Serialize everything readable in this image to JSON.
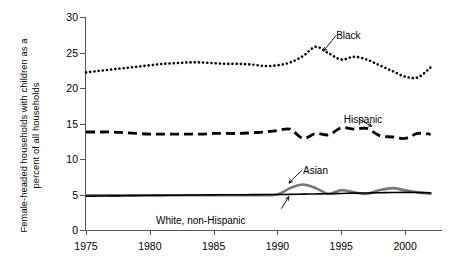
{
  "chart_data": {
    "type": "line",
    "title": "",
    "xlabel": "",
    "ylabel_line1": "Female-headed households with children as a",
    "ylabel_line2": "percent of all households",
    "xlim": [
      1975,
      2002.5
    ],
    "ylim": [
      0,
      30
    ],
    "yticks": [
      0,
      5,
      10,
      15,
      20,
      25,
      30
    ],
    "xticks": [
      1975,
      1980,
      1985,
      1990,
      1995,
      2000
    ],
    "grid": false,
    "legend": "inline annotation labels with leader lines",
    "x": [
      1975,
      1976,
      1977,
      1978,
      1979,
      1980,
      1981,
      1982,
      1983,
      1984,
      1985,
      1986,
      1987,
      1988,
      1989,
      1990,
      1991,
      1992,
      1993,
      1994,
      1995,
      1996,
      1997,
      1998,
      1999,
      2000,
      2001,
      2002
    ],
    "series": [
      {
        "name": "Black",
        "style": "dotted",
        "color": "#000000",
        "values": [
          22.2,
          22.4,
          22.6,
          22.8,
          23.0,
          23.2,
          23.4,
          23.5,
          23.6,
          23.6,
          23.5,
          23.4,
          23.4,
          23.3,
          23.1,
          23.2,
          23.6,
          24.5,
          25.8,
          24.9,
          24.0,
          24.4,
          24.0,
          23.2,
          22.4,
          21.6,
          21.5,
          22.9
        ]
      },
      {
        "name": "Hispanic",
        "style": "dashed",
        "color": "#000000",
        "values": [
          13.8,
          13.8,
          13.8,
          13.7,
          13.6,
          13.5,
          13.5,
          13.5,
          13.5,
          13.5,
          13.6,
          13.6,
          13.6,
          13.7,
          13.8,
          14.0,
          14.2,
          12.9,
          13.6,
          13.4,
          14.4,
          14.2,
          14.3,
          13.3,
          13.1,
          12.9,
          13.6,
          13.5
        ]
      },
      {
        "name": "Asian",
        "style": "solid-thick-gray",
        "color": "#777777",
        "values": [
          4.9,
          4.9,
          4.9,
          4.9,
          4.9,
          4.9,
          4.9,
          4.9,
          4.9,
          4.9,
          4.9,
          4.9,
          4.9,
          4.9,
          4.9,
          5.0,
          5.9,
          6.4,
          5.9,
          5.1,
          5.6,
          5.3,
          5.1,
          5.6,
          5.9,
          5.6,
          5.3,
          5.1
        ]
      },
      {
        "name": "White, non-Hispanic",
        "style": "solid-thin-black",
        "color": "#000000",
        "values": [
          4.75,
          4.78,
          4.8,
          4.82,
          4.84,
          4.86,
          4.88,
          4.9,
          4.92,
          4.94,
          4.95,
          4.96,
          4.97,
          4.98,
          4.99,
          5.0,
          5.02,
          5.05,
          5.08,
          5.1,
          5.15,
          5.2,
          5.22,
          5.25,
          5.28,
          5.3,
          5.28,
          5.25
        ]
      }
    ],
    "annotations": [
      {
        "label": "Black",
        "x": 1994.6,
        "y": 28.2
      },
      {
        "label": "Hispanic",
        "x": 1995.2,
        "y": 16.4
      },
      {
        "label": "Asian",
        "x": 1992.0,
        "y": 9.1
      },
      {
        "label": "White, non-Hispanic",
        "x": 1987.5,
        "y": 2.1
      }
    ]
  }
}
